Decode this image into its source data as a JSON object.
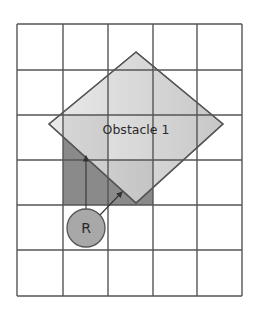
{
  "diagram": {
    "title": "",
    "grid": {
      "columns": 5,
      "rows": 6,
      "x_lines": [
        17,
        63,
        108,
        153,
        197,
        242
      ],
      "y_lines": [
        24,
        70,
        115,
        160,
        205,
        250,
        296
      ],
      "line_color": "#555555"
    },
    "obstacle": {
      "label": "Obstacle 1",
      "shape": "diamond",
      "points": "136,52 223,124 136,203 49,124",
      "fill": "#c8c8c8",
      "stroke": "#555555"
    },
    "occupied_cells": [
      {
        "col": 1,
        "row": 2
      },
      {
        "col": 1,
        "row": 3
      },
      {
        "col": 2,
        "row": 3
      }
    ],
    "occupied_fill": "#8a8a8a",
    "robot": {
      "label": "R",
      "cx": 86,
      "cy": 228,
      "r": 19,
      "fill": "#a8a8a8",
      "stroke": "#555555"
    },
    "arrows": [
      {
        "name": "sensor-ray-up",
        "x1": 86,
        "y1": 209,
        "x2": 86,
        "y2": 156
      },
      {
        "name": "sensor-ray-diagonal",
        "x1": 100,
        "y1": 215,
        "x2": 122,
        "y2": 192
      }
    ]
  }
}
